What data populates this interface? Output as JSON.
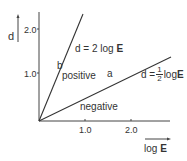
{
  "diagram": {
    "y_axis_label": "d",
    "x_axis_label_prefix": "log ",
    "x_axis_label_bold": "E",
    "y_ticks": [
      "2.0",
      "1.0"
    ],
    "x_ticks": [
      "1.0",
      "2.0"
    ],
    "line_b": {
      "label": "b",
      "region_label": "positive",
      "equation_prefix": "d = 2 log ",
      "equation_bold": "E"
    },
    "line_a": {
      "label": "a",
      "equation_prefix": "d = ",
      "fraction_num": "1",
      "fraction_den": "2",
      "equation_suffix": "log ",
      "equation_bold": "E"
    },
    "region_below": "negative"
  }
}
